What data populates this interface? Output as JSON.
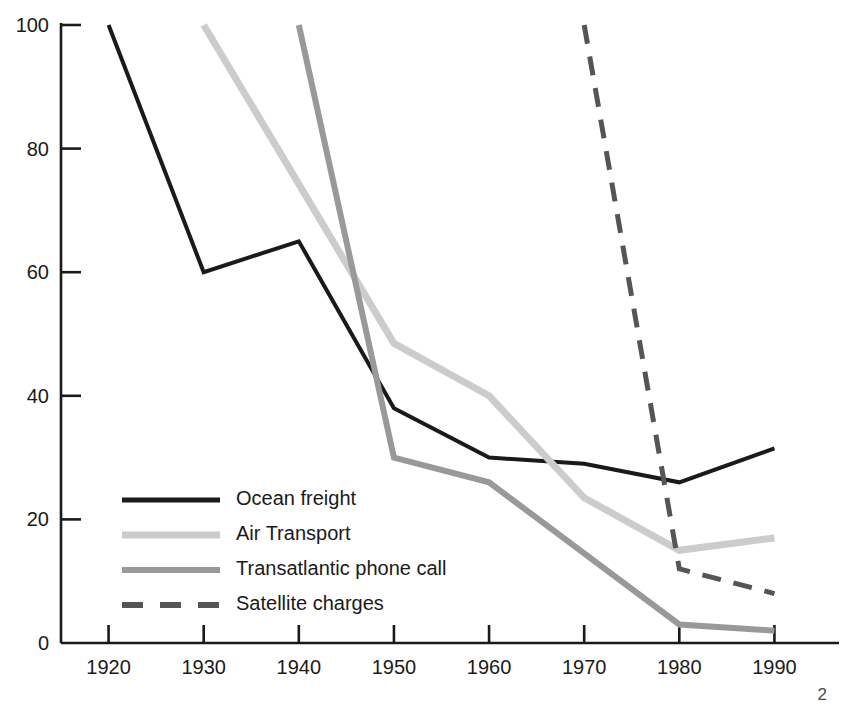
{
  "page": {
    "number": "2"
  },
  "chart_data": {
    "type": "line",
    "title": "",
    "subtitle": "",
    "xlabel": "",
    "ylabel": "",
    "x": [
      1920,
      1930,
      1940,
      1950,
      1960,
      1970,
      1980,
      1990
    ],
    "categories": [
      "1920",
      "1930",
      "1940",
      "1950",
      "1960",
      "1970",
      "1980",
      "1990"
    ],
    "xlim": [
      1915,
      1995
    ],
    "ylim": [
      0,
      100
    ],
    "yticks": [
      0,
      20,
      40,
      60,
      80,
      100
    ],
    "ytick_labels": [
      "0",
      "20",
      "40",
      "60",
      "80",
      "100"
    ],
    "xticks": [
      1920,
      1930,
      1940,
      1950,
      1960,
      1970,
      1980,
      1990
    ],
    "xtick_labels": [
      "1920",
      "1930",
      "1940",
      "1950",
      "1960",
      "1970",
      "1980",
      "1990"
    ],
    "grid": false,
    "legend_position": "lower-left-inside",
    "series": [
      {
        "name": "Ocean freight",
        "color": "#1a1a1a",
        "style": "solid",
        "width": 4,
        "x": [
          1920,
          1930,
          1940,
          1950,
          1960,
          1970,
          1980,
          1990
        ],
        "values": [
          100,
          60,
          65,
          38,
          30,
          29,
          26,
          31.5
        ]
      },
      {
        "name": "Air Transport",
        "color": "#cccccc",
        "style": "solid",
        "width": 7,
        "x": [
          1930,
          1950,
          1960,
          1970,
          1980,
          1990
        ],
        "values": [
          100,
          48.5,
          40,
          23.5,
          15,
          17
        ]
      },
      {
        "name": "Transatlantic phone call",
        "color": "#999999",
        "style": "solid",
        "width": 6,
        "x": [
          1940,
          1950,
          1960,
          1980,
          1990
        ],
        "values": [
          100,
          30,
          26,
          3,
          2
        ]
      },
      {
        "name": "Satellite charges",
        "color": "#555555",
        "style": "dashed",
        "width": 5,
        "x": [
          1970,
          1980,
          1990
        ],
        "values": [
          100,
          12,
          8
        ]
      }
    ],
    "legend": [
      {
        "label": "Ocean freight",
        "color": "#1a1a1a",
        "style": "solid",
        "width": 5
      },
      {
        "label": "Air Transport",
        "color": "#cccccc",
        "style": "solid",
        "width": 7
      },
      {
        "label": "Transatlantic phone call",
        "color": "#999999",
        "style": "solid",
        "width": 6
      },
      {
        "label": "Satellite charges",
        "color": "#555555",
        "style": "dashed",
        "width": 6
      }
    ]
  }
}
